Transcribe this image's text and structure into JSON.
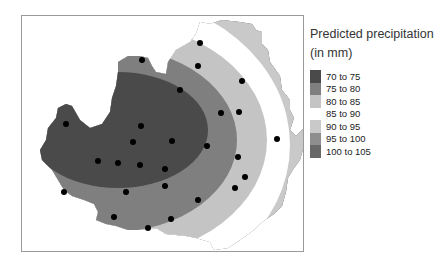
{
  "legend": {
    "title_line1": "Predicted precipitation",
    "title_line2": "(in mm)",
    "items": [
      {
        "label": "70 to 75",
        "color": "#4a4a4a"
      },
      {
        "label": "75 to 80",
        "color": "#7f7f7f"
      },
      {
        "label": "80 to 85",
        "color": "#c4c4c4"
      },
      {
        "label": "85 to 90",
        "color": "#ffffff"
      },
      {
        "label": "90 to 95",
        "color": "#c9c9c9"
      },
      {
        "label": "95 to 100",
        "color": "#8e8e8e"
      },
      {
        "label": "100 to 105",
        "color": "#686868"
      }
    ]
  },
  "map": {
    "stations": [
      [
        142,
        60
      ],
      [
        200,
        43
      ],
      [
        198,
        66
      ],
      [
        242,
        81
      ],
      [
        180,
        90
      ],
      [
        66,
        124
      ],
      [
        141,
        126
      ],
      [
        221,
        113
      ],
      [
        239,
        112
      ],
      [
        133,
        142
      ],
      [
        172,
        141
      ],
      [
        277,
        139
      ],
      [
        207,
        146
      ],
      [
        98,
        161
      ],
      [
        118,
        163
      ],
      [
        140,
        165
      ],
      [
        165,
        169
      ],
      [
        238,
        157
      ],
      [
        245,
        177
      ],
      [
        235,
        188
      ],
      [
        126,
        192
      ],
      [
        165,
        186
      ],
      [
        64,
        192
      ],
      [
        198,
        200
      ],
      [
        114,
        217
      ],
      [
        171,
        219
      ],
      [
        148,
        228
      ]
    ]
  }
}
